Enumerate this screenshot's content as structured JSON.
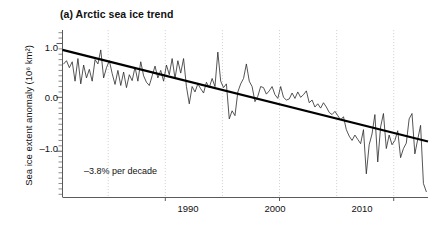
{
  "figure": {
    "panel_label": "(a)",
    "title": "(a) Arctic sea ice trend",
    "annotation": "–3.8% per decade"
  },
  "axes": {
    "y_title_main": "Sea ice extent anomaly (10",
    "y_title_sup": "6",
    "y_title_tail": " km²)",
    "y_title_full": "Sea ice extent anomaly (10⁶ km²)",
    "y_ticks": [
      "1.0",
      "0.0",
      "–1.0"
    ],
    "x_ticks": [
      "1990",
      "2000",
      "2010"
    ]
  },
  "chart_data": {
    "type": "line",
    "title": "(a) Arctic sea ice trend",
    "xlabel": "",
    "ylabel": "Sea ice extent anomaly (10⁶ km²)",
    "xlim": [
      1981.0,
      2013.0
    ],
    "ylim": [
      -1.85,
      1.25
    ],
    "y_tick_values": [
      1.0,
      0.0,
      -1.0
    ],
    "x_tick_values": [
      1990,
      2000,
      2010
    ],
    "gridlines": {
      "x": [
        1985,
        1990,
        1995,
        2000,
        2005,
        2010
      ],
      "y": [],
      "style": "dotted-vertical-light-gray"
    },
    "legend": "none",
    "annotations": [
      {
        "text": "–3.8% per decade",
        "x": 1983.2,
        "y": -1.45
      }
    ],
    "series": [
      {
        "name": "Sea ice extent anomaly",
        "type": "line",
        "color": "#2a2a2a",
        "line_width": 0.8,
        "x": [
          1981.1,
          1981.35,
          1981.6,
          1981.85,
          1982.1,
          1982.35,
          1982.6,
          1982.85,
          1983.1,
          1983.35,
          1983.6,
          1983.85,
          1984.1,
          1984.35,
          1984.6,
          1984.85,
          1985.1,
          1985.35,
          1985.6,
          1985.85,
          1986.1,
          1986.35,
          1986.6,
          1986.85,
          1987.1,
          1987.35,
          1987.6,
          1987.85,
          1988.1,
          1988.35,
          1988.6,
          1988.85,
          1989.1,
          1989.35,
          1989.6,
          1989.85,
          1990.1,
          1990.35,
          1990.6,
          1990.85,
          1991.1,
          1991.35,
          1991.6,
          1991.85,
          1992.1,
          1992.35,
          1992.6,
          1992.85,
          1993.1,
          1993.35,
          1993.6,
          1993.85,
          1994.1,
          1994.35,
          1994.6,
          1994.85,
          1995.1,
          1995.35,
          1995.6,
          1995.85,
          1996.1,
          1996.35,
          1996.6,
          1996.85,
          1997.1,
          1997.35,
          1997.6,
          1997.85,
          1998.1,
          1998.35,
          1998.6,
          1998.85,
          1999.1,
          1999.35,
          1999.6,
          1999.85,
          2000.1,
          2000.35,
          2000.6,
          2000.85,
          2001.1,
          2001.35,
          2001.6,
          2001.85,
          2002.1,
          2002.35,
          2002.6,
          2002.85,
          2003.1,
          2003.35,
          2003.6,
          2003.85,
          2004.1,
          2004.35,
          2004.6,
          2004.85,
          2005.1,
          2005.35,
          2005.6,
          2005.85,
          2006.1,
          2006.35,
          2006.6,
          2006.85,
          2007.1,
          2007.35,
          2007.6,
          2007.85,
          2008.1,
          2008.35,
          2008.6,
          2008.85,
          2009.1,
          2009.35,
          2009.6,
          2009.85,
          2010.1,
          2010.35,
          2010.6,
          2010.85,
          2011.1,
          2011.35,
          2011.6,
          2011.85,
          2012.1,
          2012.35,
          2012.6,
          2012.85
        ],
        "y": [
          0.62,
          0.68,
          0.55,
          0.66,
          0.3,
          0.72,
          0.25,
          0.6,
          0.36,
          0.52,
          0.3,
          0.7,
          0.62,
          0.88,
          0.36,
          0.55,
          0.68,
          0.44,
          0.24,
          0.5,
          0.22,
          0.47,
          0.18,
          0.42,
          0.31,
          0.56,
          0.3,
          0.66,
          0.4,
          0.28,
          0.22,
          0.4,
          0.58,
          0.36,
          0.5,
          0.3,
          0.6,
          0.42,
          0.72,
          0.35,
          0.68,
          0.45,
          0.72,
          0.2,
          -0.12,
          0.2,
          0.1,
          0.25,
          0.16,
          0.08,
          0.28,
          0.18,
          0.35,
          0.2,
          0.84,
          0.3,
          0.18,
          0.25,
          -0.4,
          -0.25,
          -0.34,
          0.1,
          0.25,
          0.35,
          0.62,
          0.3,
          0.2,
          -0.08,
          0.02,
          0.2,
          0.18,
          0.06,
          0.12,
          0.2,
          0.05,
          -0.02,
          0.2,
          0.0,
          -0.05,
          -0.03,
          0.08,
          -0.02,
          0.1,
          0.0,
          0.05,
          0.12,
          -0.1,
          -0.05,
          -0.18,
          -0.12,
          -0.2,
          -0.1,
          -0.18,
          -0.28,
          -0.32,
          -0.26,
          -0.34,
          -0.42,
          -0.36,
          -0.6,
          -0.72,
          -0.8,
          -0.7,
          -0.78,
          -0.86,
          -0.6,
          -1.42,
          -0.88,
          -0.68,
          -0.32,
          -1.2,
          -0.55,
          -0.3,
          -0.95,
          -0.7,
          -0.88,
          -0.8,
          -0.62,
          -1.12,
          -0.95,
          -0.85,
          -0.4,
          -0.3,
          -1.05,
          -0.78,
          -0.52,
          -1.6,
          -1.75
        ]
      },
      {
        "name": "Linear trend",
        "type": "trendline",
        "color": "#000000",
        "line_width": 2.2,
        "x": [
          1981.0,
          2013.0
        ],
        "y": [
          0.88,
          -0.82
        ],
        "slope_per_decade": -0.53
      }
    ]
  }
}
